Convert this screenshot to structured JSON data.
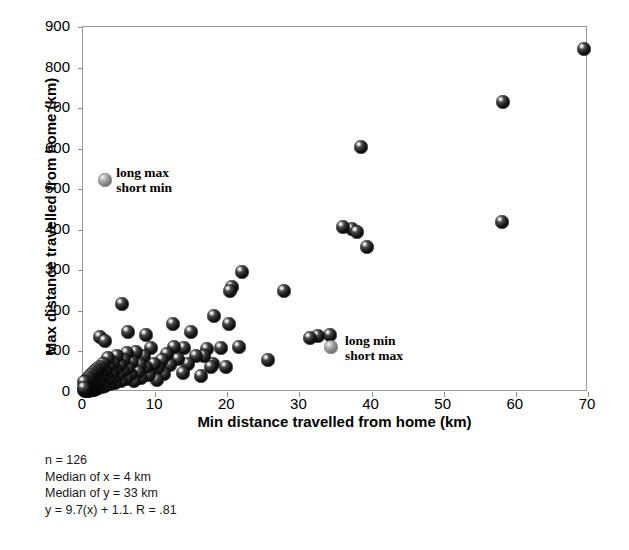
{
  "chart_data": {
    "type": "scatter",
    "title": "",
    "xlabel": "Min distance travelled from home (km)",
    "ylabel": "Max distance travelled from home (km)",
    "xlim": [
      0,
      70
    ],
    "ylim": [
      0,
      900
    ],
    "xticks": [
      0,
      10,
      20,
      30,
      40,
      50,
      60,
      70
    ],
    "yticks": [
      0,
      100,
      200,
      300,
      400,
      500,
      600,
      700,
      800,
      900
    ],
    "xtick_labels": [
      "0",
      "10",
      "20",
      "30",
      "40",
      "50",
      "60",
      "70"
    ],
    "ytick_labels": [
      "0",
      "100",
      "200",
      "300",
      "400",
      "500",
      "600",
      "700",
      "800",
      "900"
    ],
    "grid": false,
    "legend": null,
    "marker_style": "3d-shaded-sphere",
    "series": [
      {
        "name": "individuals",
        "color": "#111111",
        "points": [
          [
            69.5,
            845
          ],
          [
            58.2,
            715
          ],
          [
            58.1,
            420
          ],
          [
            38.6,
            605
          ],
          [
            39.3,
            357
          ],
          [
            37.3,
            402
          ],
          [
            36.0,
            408
          ],
          [
            38.0,
            395
          ],
          [
            34.2,
            140
          ],
          [
            32.6,
            137
          ],
          [
            31.4,
            133
          ],
          [
            27.9,
            248
          ],
          [
            25.7,
            78
          ],
          [
            22.0,
            297
          ],
          [
            20.6,
            258
          ],
          [
            20.4,
            250
          ],
          [
            20.3,
            168
          ],
          [
            21.6,
            112
          ],
          [
            19.1,
            108
          ],
          [
            18.1,
            188
          ],
          [
            18.0,
            70
          ],
          [
            17.8,
            62
          ],
          [
            17.2,
            105
          ],
          [
            16.8,
            88
          ],
          [
            16.3,
            40
          ],
          [
            15.6,
            88
          ],
          [
            14.6,
            68
          ],
          [
            14.0,
            108
          ],
          [
            13.2,
            82
          ],
          [
            13.8,
            47
          ],
          [
            12.6,
            112
          ],
          [
            12.0,
            67
          ],
          [
            11.6,
            94
          ],
          [
            11.2,
            45
          ],
          [
            10.9,
            80
          ],
          [
            10.4,
            58
          ],
          [
            10.2,
            30
          ],
          [
            9.8,
            70
          ],
          [
            9.4,
            108
          ],
          [
            9.1,
            42
          ],
          [
            8.7,
            62
          ],
          [
            8.4,
            88
          ],
          [
            8.1,
            35
          ],
          [
            7.9,
            66
          ],
          [
            7.6,
            50
          ],
          [
            7.3,
            98
          ],
          [
            7.0,
            28
          ],
          [
            6.8,
            74
          ],
          [
            6.6,
            44
          ],
          [
            6.3,
            60
          ],
          [
            6.1,
            96
          ],
          [
            5.9,
            33
          ],
          [
            5.7,
            80
          ],
          [
            5.5,
            52
          ],
          [
            5.3,
            26
          ],
          [
            5.1,
            67
          ],
          [
            4.9,
            41
          ],
          [
            4.7,
            88
          ],
          [
            4.5,
            22
          ],
          [
            4.4,
            57
          ],
          [
            4.2,
            35
          ],
          [
            4.1,
            72
          ],
          [
            3.9,
            48
          ],
          [
            3.8,
            19
          ],
          [
            3.6,
            63
          ],
          [
            3.5,
            30
          ],
          [
            3.4,
            84
          ],
          [
            3.2,
            44
          ],
          [
            3.1,
            15
          ],
          [
            3.0,
            55
          ],
          [
            2.9,
            26
          ],
          [
            2.8,
            70
          ],
          [
            2.7,
            38
          ],
          [
            2.6,
            12
          ],
          [
            2.5,
            50
          ],
          [
            2.4,
            22
          ],
          [
            2.3,
            61
          ],
          [
            2.2,
            33
          ],
          [
            2.1,
            10
          ],
          [
            2.0,
            45
          ],
          [
            1.95,
            18
          ],
          [
            1.9,
            56
          ],
          [
            1.85,
            28
          ],
          [
            1.8,
            8
          ],
          [
            1.75,
            40
          ],
          [
            1.7,
            15
          ],
          [
            1.65,
            52
          ],
          [
            1.6,
            24
          ],
          [
            1.55,
            6
          ],
          [
            1.5,
            36
          ],
          [
            1.45,
            12
          ],
          [
            1.4,
            46
          ],
          [
            1.35,
            20
          ],
          [
            1.3,
            5
          ],
          [
            1.25,
            31
          ],
          [
            1.2,
            10
          ],
          [
            1.15,
            41
          ],
          [
            1.1,
            17
          ],
          [
            1.05,
            4
          ],
          [
            1.0,
            27
          ],
          [
            0.95,
            8
          ],
          [
            0.9,
            36
          ],
          [
            0.85,
            14
          ],
          [
            0.8,
            3
          ],
          [
            0.75,
            23
          ],
          [
            0.7,
            7
          ],
          [
            0.65,
            32
          ],
          [
            0.6,
            12
          ],
          [
            0.55,
            2
          ],
          [
            0.5,
            19
          ],
          [
            0.45,
            6
          ],
          [
            0.4,
            28
          ],
          [
            0.35,
            10
          ],
          [
            0.3,
            2
          ],
          [
            0.25,
            16
          ],
          [
            0.2,
            5
          ],
          [
            0.15,
            24
          ],
          [
            0.1,
            9
          ],
          [
            5.4,
            218
          ],
          [
            2.4,
            135
          ],
          [
            3.0,
            125
          ],
          [
            12.5,
            168
          ],
          [
            6.2,
            148
          ],
          [
            8.8,
            140
          ],
          [
            19.8,
            62
          ],
          [
            15.0,
            148
          ]
        ]
      },
      {
        "name": "highlighted",
        "color": "#8a8a8a",
        "points": [
          [
            3.0,
            522
          ],
          [
            34.4,
            112
          ]
        ]
      }
    ],
    "annotations": [
      {
        "id": "long-max-short-min",
        "lines": [
          "long max",
          "short min"
        ],
        "x": 4.6,
        "y": 540,
        "target": [
          3.0,
          522
        ]
      },
      {
        "id": "long-min-short-max",
        "lines": [
          "long min",
          "short max"
        ],
        "x": 36.3,
        "y": 125,
        "target": [
          34.4,
          112
        ]
      }
    ],
    "stats": {
      "n": "n = 126",
      "median_x": "Median of x  = 4 km",
      "median_y": "Median of y = 33 km",
      "regression": "y = 9.7(x) + 1.1. R = .81"
    }
  }
}
